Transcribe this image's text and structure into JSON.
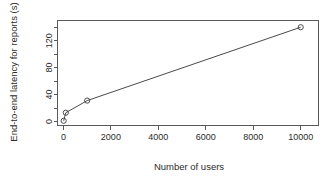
{
  "chart_data": {
    "type": "line",
    "title": "",
    "xlabel": "Number of users",
    "ylabel": "End-to-end latency for reports (s)",
    "x": [
      10,
      100,
      1000,
      10000
    ],
    "values": [
      1,
      13,
      31,
      140
    ],
    "series": [
      {
        "name": "End-to-end latency",
        "values": [
          1,
          13,
          31,
          140
        ]
      }
    ],
    "xlim": [
      -250,
      10750
    ],
    "ylim": [
      -6,
      150
    ],
    "xticks": [
      0,
      2000,
      4000,
      6000,
      8000,
      10000
    ],
    "xtick_labels": [
      "0",
      "2000",
      "4000",
      "6000",
      "8000",
      "10000"
    ],
    "yticks": [
      0,
      40,
      80,
      120
    ],
    "ytick_labels": [
      "0",
      "40",
      "80",
      "120"
    ],
    "yminor_ticks": [
      20,
      60,
      100,
      140
    ],
    "grid": false,
    "legend": "none",
    "marker": "open-circle",
    "line_color": "#4a4a4a",
    "marker_color": "#4a4a4a",
    "axis_color": "#595959",
    "background": "#ffffff"
  }
}
